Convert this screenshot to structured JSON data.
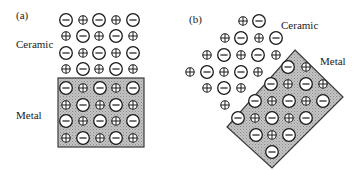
{
  "panel_a": {
    "label": "(a)",
    "ceramic_label": "Ceramic",
    "metal_label": "Metal",
    "metal_box": {
      "x": 58,
      "y": 78,
      "w": 86,
      "h": 69
    },
    "ceramic_ions": [
      {
        "x": 66,
        "y": 20,
        "c": "-"
      },
      {
        "x": 83,
        "y": 20,
        "c": "+"
      },
      {
        "x": 99,
        "y": 20,
        "c": "-"
      },
      {
        "x": 116,
        "y": 20,
        "c": "+"
      },
      {
        "x": 133,
        "y": 20,
        "c": "-"
      },
      {
        "x": 66,
        "y": 36,
        "c": "+"
      },
      {
        "x": 83,
        "y": 36,
        "c": "-"
      },
      {
        "x": 99,
        "y": 36,
        "c": "+"
      },
      {
        "x": 116,
        "y": 36,
        "c": "-"
      },
      {
        "x": 133,
        "y": 36,
        "c": "+"
      },
      {
        "x": 66,
        "y": 53,
        "c": "-"
      },
      {
        "x": 83,
        "y": 53,
        "c": "+"
      },
      {
        "x": 99,
        "y": 53,
        "c": "-"
      },
      {
        "x": 116,
        "y": 53,
        "c": "+"
      },
      {
        "x": 133,
        "y": 53,
        "c": "-"
      },
      {
        "x": 66,
        "y": 69,
        "c": "+"
      },
      {
        "x": 83,
        "y": 69,
        "c": "-"
      },
      {
        "x": 99,
        "y": 69,
        "c": "+"
      },
      {
        "x": 116,
        "y": 69,
        "c": "-"
      },
      {
        "x": 133,
        "y": 69,
        "c": "+"
      }
    ],
    "metal_ions": [
      {
        "x": 66,
        "y": 88,
        "c": "-"
      },
      {
        "x": 83,
        "y": 88,
        "c": "+"
      },
      {
        "x": 100,
        "y": 88,
        "c": "-"
      },
      {
        "x": 116,
        "y": 88,
        "c": "+"
      },
      {
        "x": 133,
        "y": 88,
        "c": "-"
      },
      {
        "x": 66,
        "y": 105,
        "c": "+"
      },
      {
        "x": 83,
        "y": 105,
        "c": "-"
      },
      {
        "x": 100,
        "y": 105,
        "c": "+"
      },
      {
        "x": 116,
        "y": 105,
        "c": "-"
      },
      {
        "x": 133,
        "y": 105,
        "c": "+"
      },
      {
        "x": 66,
        "y": 121,
        "c": "-"
      },
      {
        "x": 83,
        "y": 121,
        "c": "+"
      },
      {
        "x": 100,
        "y": 121,
        "c": "-"
      },
      {
        "x": 116,
        "y": 121,
        "c": "+"
      },
      {
        "x": 133,
        "y": 121,
        "c": "-"
      },
      {
        "x": 66,
        "y": 138,
        "c": "+"
      },
      {
        "x": 83,
        "y": 138,
        "c": "-"
      },
      {
        "x": 100,
        "y": 138,
        "c": "+"
      },
      {
        "x": 116,
        "y": 138,
        "c": "-"
      },
      {
        "x": 133,
        "y": 138,
        "c": "+"
      }
    ]
  },
  "panel_b": {
    "label": "(b)",
    "ceramic_label": "Ceramic",
    "metal_label": "Metal",
    "metal_polygon": "295,50 343,97 272,168 227,127",
    "ceramic_ions": [
      {
        "x": 243,
        "y": 21,
        "c": "+"
      },
      {
        "x": 259,
        "y": 21,
        "c": "-"
      },
      {
        "x": 225,
        "y": 38,
        "c": "+"
      },
      {
        "x": 241,
        "y": 38,
        "c": "-"
      },
      {
        "x": 259,
        "y": 38,
        "c": "+"
      },
      {
        "x": 276,
        "y": 38,
        "c": "-"
      },
      {
        "x": 207,
        "y": 55,
        "c": "+"
      },
      {
        "x": 224,
        "y": 55,
        "c": "-"
      },
      {
        "x": 241,
        "y": 55,
        "c": "+"
      },
      {
        "x": 258,
        "y": 55,
        "c": "-"
      },
      {
        "x": 276,
        "y": 55,
        "c": "+"
      },
      {
        "x": 190,
        "y": 72,
        "c": "+"
      },
      {
        "x": 207,
        "y": 72,
        "c": "-"
      },
      {
        "x": 224,
        "y": 72,
        "c": "+"
      },
      {
        "x": 241,
        "y": 72,
        "c": "-"
      },
      {
        "x": 258,
        "y": 72,
        "c": "+"
      },
      {
        "x": 207,
        "y": 88,
        "c": "+"
      },
      {
        "x": 224,
        "y": 88,
        "c": "-"
      },
      {
        "x": 241,
        "y": 88,
        "c": "+"
      },
      {
        "x": 225,
        "y": 105,
        "c": "+"
      }
    ],
    "metal_ions": [
      {
        "x": 288,
        "y": 67,
        "c": "-"
      },
      {
        "x": 306,
        "y": 67,
        "c": "+"
      },
      {
        "x": 271,
        "y": 84,
        "c": "-"
      },
      {
        "x": 288,
        "y": 84,
        "c": "+"
      },
      {
        "x": 306,
        "y": 84,
        "c": "-"
      },
      {
        "x": 323,
        "y": 84,
        "c": "+"
      },
      {
        "x": 255,
        "y": 101,
        "c": "-"
      },
      {
        "x": 272,
        "y": 101,
        "c": "+"
      },
      {
        "x": 289,
        "y": 101,
        "c": "-"
      },
      {
        "x": 306,
        "y": 101,
        "c": "+"
      },
      {
        "x": 323,
        "y": 101,
        "c": "-"
      },
      {
        "x": 238,
        "y": 118,
        "c": "-"
      },
      {
        "x": 255,
        "y": 118,
        "c": "+"
      },
      {
        "x": 272,
        "y": 118,
        "c": "-"
      },
      {
        "x": 289,
        "y": 118,
        "c": "+"
      },
      {
        "x": 306,
        "y": 118,
        "c": "-"
      },
      {
        "x": 256,
        "y": 135,
        "c": "-"
      },
      {
        "x": 272,
        "y": 135,
        "c": "+"
      },
      {
        "x": 289,
        "y": 135,
        "c": "-"
      },
      {
        "x": 272,
        "y": 152,
        "c": "-"
      }
    ]
  },
  "legend": {
    "anion_symbol": "minus-in-circle (large)",
    "cation_symbol": "plus-in-circle (small)"
  },
  "colors": {
    "ink": "#1a1a1a",
    "metal_fill": "#b4b4b4",
    "background": "#ffffff"
  }
}
